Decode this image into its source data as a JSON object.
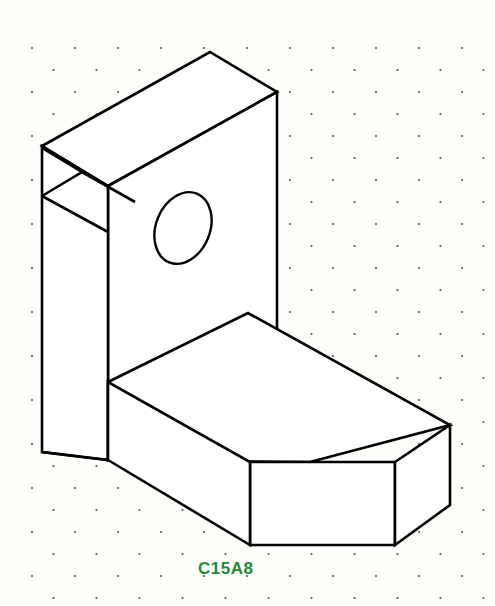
{
  "sheet": {
    "width": 495,
    "height": 606,
    "background_color": "#fdfdfa",
    "title": "C15A8"
  },
  "label": {
    "text": "C15A8",
    "color": "#1f8b3a",
    "x": 198,
    "y": 574
  },
  "grid": {
    "name": "isometric-dot-grid",
    "dot_color": "#5a5a5a",
    "dot_radius": 1.1,
    "column_spacing": 43,
    "row_spacing": 22,
    "origin_x": 32,
    "origin_y": 48,
    "stagger_offset": 21.5
  },
  "linework": {
    "stroke_color": "#000000",
    "fill_color": "#ffffff",
    "stroke_width": 2.6
  },
  "part": {
    "name": "angle-bracket-with-hole",
    "projection": "isometric",
    "faces": [
      {
        "name": "vertical-plate-top-face",
        "points": "42,146 210,52 277,92 108,186"
      },
      {
        "name": "vertical-plate-front-face",
        "points": "108,186 277,92 277,385 108,460"
      },
      {
        "name": "vertical-plate-left-face",
        "points": "42,146 108,186 108,460 42,452"
      },
      {
        "name": "base-top-face",
        "points": "108,382 248,313 450,425 310,462 108,460"
      },
      {
        "name": "base-front-face",
        "points": "250,462 395,462 395,545 250,545"
      },
      {
        "name": "base-left-face",
        "points": "108,460 250,545 250,462 108,382"
      },
      {
        "name": "base-right-chamfer-face",
        "points": "395,462 450,425 450,505 395,545"
      }
    ],
    "edges": [
      {
        "name": "notch-v-cut",
        "points": "42,148 82,172 42,196"
      },
      {
        "name": "notch-lower-leg",
        "points": "82,172 135,202"
      },
      {
        "name": "notch-upper-return",
        "points": "42,196 108,232"
      },
      {
        "name": "plate-bottom-left-vee",
        "points": "42,452 108,460"
      }
    ],
    "hole": {
      "name": "elliptical-hole",
      "cx": 183,
      "cy": 228,
      "rx": 27,
      "ry": 37,
      "rotation": 22
    }
  }
}
